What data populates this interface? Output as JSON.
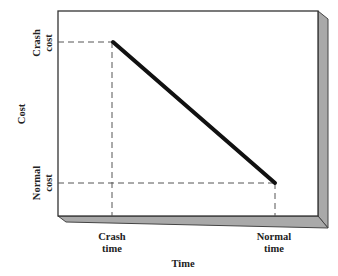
{
  "diagram": {
    "y_axis_label": "Cost",
    "x_axis_label": "Time",
    "y_ticks": [
      {
        "line1": "Crash",
        "line2": "cost"
      },
      {
        "line1": "Normal",
        "line2": "cost"
      }
    ],
    "x_ticks": [
      {
        "line1": "Crash",
        "line2": "time"
      },
      {
        "line1": "Normal",
        "line2": "time"
      }
    ],
    "line": {
      "from": {
        "label": "Crash time / Crash cost"
      },
      "to": {
        "label": "Normal time / Normal cost"
      }
    },
    "colors": {
      "line": "#111111",
      "frame": "#333333",
      "depth": "#a9a9a9",
      "dash": "#555555"
    }
  }
}
